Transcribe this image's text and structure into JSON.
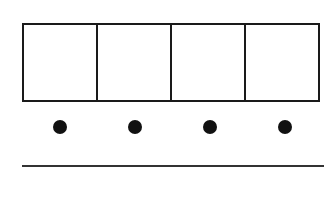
{
  "diagram": {
    "type": "ten-frame-strip",
    "cells": [
      {
        "id": 1,
        "content": ""
      },
      {
        "id": 2,
        "content": ""
      },
      {
        "id": 3,
        "content": ""
      },
      {
        "id": 4,
        "content": ""
      }
    ],
    "dots": [
      {
        "id": 1
      },
      {
        "id": 2
      },
      {
        "id": 3
      },
      {
        "id": 4
      }
    ],
    "answer_line": {
      "value": ""
    },
    "colors": {
      "stroke": "#1a1a1a",
      "dot": "#111111",
      "background": "#ffffff"
    }
  }
}
